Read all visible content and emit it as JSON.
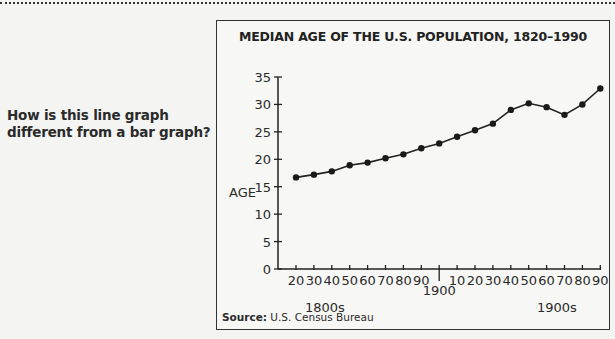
{
  "question": {
    "line1": "How is this line graph",
    "line2": "different from a bar graph?"
  },
  "chart": {
    "title": "MEDIAN AGE OF THE U.S. POPULATION, 1820–1990",
    "ylabel": "AGE",
    "y_ticks": [
      "0",
      "5",
      "10",
      "15",
      "20",
      "25",
      "30",
      "35"
    ],
    "x_ticks_1800s": [
      "20",
      "30",
      "40",
      "50",
      "60",
      "70",
      "80",
      "90"
    ],
    "x_tick_1900": "1900",
    "x_ticks_1900s": [
      "10",
      "20",
      "30",
      "40",
      "50",
      "60",
      "70",
      "80",
      "90"
    ],
    "century_label_1800s": "1800s",
    "century_label_1900s": "1900s",
    "source_label": "Source:",
    "source_text": "U.S. Census Bureau",
    "line_color": "#222222",
    "box_border_color": "#333333"
  },
  "chart_data": {
    "type": "line",
    "title": "MEDIAN AGE OF THE U.S. POPULATION, 1820–1990",
    "xlabel": "",
    "ylabel": "AGE",
    "ylim": [
      0,
      35
    ],
    "y_ticks": [
      0,
      5,
      10,
      15,
      20,
      25,
      30,
      35
    ],
    "grid": false,
    "legend": null,
    "x": [
      1820,
      1830,
      1840,
      1850,
      1860,
      1870,
      1880,
      1890,
      1900,
      1910,
      1920,
      1930,
      1940,
      1950,
      1960,
      1970,
      1980,
      1990
    ],
    "x_tick_labels": [
      "20",
      "30",
      "40",
      "50",
      "60",
      "70",
      "80",
      "90",
      "1900",
      "10",
      "20",
      "30",
      "40",
      "50",
      "60",
      "70",
      "80",
      "90"
    ],
    "x_group_labels": [
      "1800s",
      "1900s"
    ],
    "series": [
      {
        "name": "Median age",
        "values": [
          16.7,
          17.2,
          17.8,
          18.9,
          19.4,
          20.2,
          20.9,
          22.0,
          22.9,
          24.1,
          25.3,
          26.5,
          29.0,
          30.2,
          29.5,
          28.1,
          30.0,
          32.9
        ]
      }
    ],
    "source": "Source: U.S. Census Bureau"
  }
}
